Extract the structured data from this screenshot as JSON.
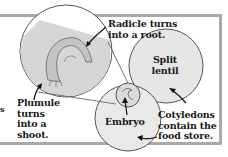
{
  "diagram": {
    "labels": {
      "radicle": "Radicle turns\ninto a root.",
      "split_lentil": "Split\nlentil",
      "plumule": "Plumule\nturns\ninto a\nshoot.",
      "embryo": "Embryo",
      "cotyledons": "Cotyledons\ncontain the\nfood store.",
      "edge_fragment": "s"
    },
    "colors": {
      "frame": "#a9a9a9",
      "circle_fill": "#e6e6e6",
      "circle_stroke": "#555555",
      "text": "#1a1a1a"
    }
  }
}
